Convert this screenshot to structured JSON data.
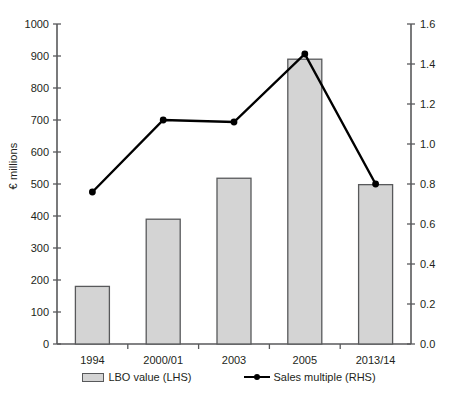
{
  "chart_data": {
    "type": "bar",
    "title": "",
    "subtitle": "",
    "xlabel": "",
    "ylabel": "€ millions",
    "y2label": "",
    "categories": [
      "1994",
      "2000/01",
      "2003",
      "2005",
      "2013/14"
    ],
    "ylim": [
      0,
      1000
    ],
    "y2lim": [
      0.0,
      1.6
    ],
    "yticks": [
      "0",
      "100",
      "200",
      "300",
      "400",
      "500",
      "600",
      "700",
      "800",
      "900",
      "1000"
    ],
    "ytick_values": [
      0,
      100,
      200,
      300,
      400,
      500,
      600,
      700,
      800,
      900,
      1000
    ],
    "y2ticks": [
      "0.0",
      "0.2",
      "0.4",
      "0.6",
      "0.8",
      "1.0",
      "1.2",
      "1.4",
      "1.6"
    ],
    "y2tick_values": [
      0.0,
      0.2,
      0.4,
      0.6,
      0.8,
      1.0,
      1.2,
      1.4,
      1.6
    ],
    "grid": false,
    "legend_position": "bottom",
    "series": [
      {
        "name": "LBO value (LHS)",
        "type": "bar",
        "axis": "left",
        "fill": "#d4d4d4",
        "stroke": "#58595b",
        "values": [
          180,
          390,
          518,
          890,
          498
        ]
      },
      {
        "name": "Sales multiple (RHS)",
        "type": "line",
        "axis": "right",
        "stroke": "#000000",
        "marker": "circle",
        "values": [
          0.76,
          1.12,
          1.11,
          1.45,
          0.8
        ]
      }
    ]
  },
  "legend": {
    "items": [
      {
        "label": "LBO value (LHS)",
        "marker": "bar-swatch"
      },
      {
        "label": "Sales multiple (RHS)",
        "marker": "line-marker"
      }
    ]
  }
}
